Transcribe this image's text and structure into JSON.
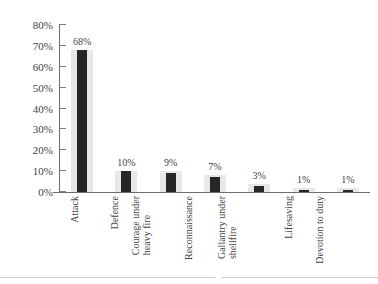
{
  "chart_data": {
    "type": "bar",
    "title": "",
    "subtitle": "",
    "xlabel": "",
    "ylabel": "",
    "categories": [
      "Attack",
      "Defence",
      "Courage under heavy fire",
      "Reconnaissance",
      "Gallantry under shellfire",
      "Lifesaving",
      "Devotion to duty"
    ],
    "category_lines": [
      [
        "Attack"
      ],
      [
        "Defence"
      ],
      [
        "Courage under",
        "heavy fire"
      ],
      [
        "Reconnaissance"
      ],
      [
        "Gallantry under",
        "shellfire"
      ],
      [
        "Lifesaving"
      ],
      [
        "Devotion to duty"
      ]
    ],
    "values": [
      68,
      10,
      9,
      7,
      3,
      1,
      1
    ],
    "data_labels": [
      "68%",
      "10%",
      "9%",
      "7%",
      "3%",
      "1%",
      "1%"
    ],
    "band_values": [
      68,
      10,
      10,
      8,
      4,
      2,
      2
    ],
    "ylim": [
      0,
      80
    ],
    "ytick_values": [
      80,
      70,
      60,
      50,
      40,
      30,
      20,
      10,
      0
    ],
    "ytick_labels": [
      "80%",
      "70%",
      "60%",
      "50%",
      "40%",
      "30%",
      "20%",
      "10%",
      "0%"
    ],
    "grid": false,
    "legend": "none",
    "colors": {
      "bar": "#262626",
      "band": "#e8e8e8",
      "axis": "#6e6e6e",
      "text": "#434343",
      "background": "#ffffff",
      "footer_rule": "#cfcfcf"
    }
  }
}
